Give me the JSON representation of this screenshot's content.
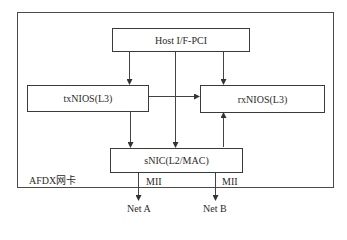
{
  "diagram": {
    "container_label": "AFDX网卡",
    "blocks": {
      "host": "Host I/F-PCI",
      "tx": "txNIOS(L3)",
      "rx": "rxNIOS(L3)",
      "snic": "sNIC(L2/MAC)"
    },
    "interfaces": {
      "left_mii": "MII",
      "right_mii": "MII"
    },
    "networks": {
      "a": "Net A",
      "b": "Net B"
    },
    "connections": [
      {
        "from": "Host I/F-PCI",
        "to": "txNIOS(L3)",
        "type": "bidirectional"
      },
      {
        "from": "Host I/F-PCI",
        "to": "rxNIOS(L3)",
        "type": "bidirectional"
      },
      {
        "from": "Host I/F-PCI",
        "to": "sNIC(L2/MAC)",
        "type": "bidirectional"
      },
      {
        "from": "txNIOS(L3)",
        "to": "rxNIOS(L3)",
        "type": "bidirectional"
      },
      {
        "from": "txNIOS(L3)",
        "to": "sNIC(L2/MAC)",
        "type": "directed"
      },
      {
        "from": "sNIC(L2/MAC)",
        "to": "rxNIOS(L3)",
        "type": "directed"
      },
      {
        "from": "sNIC(L2/MAC)",
        "to": "Net A",
        "type": "bidirectional",
        "label": "MII"
      },
      {
        "from": "sNIC(L2/MAC)",
        "to": "Net B",
        "type": "bidirectional",
        "label": "MII"
      }
    ]
  }
}
